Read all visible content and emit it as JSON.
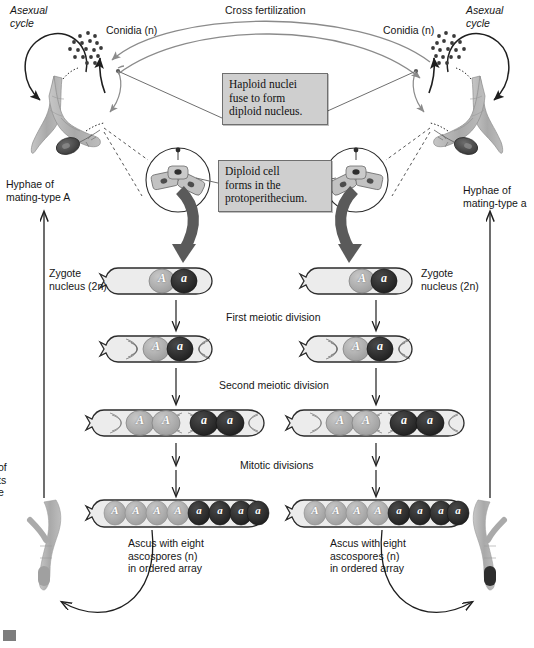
{
  "figure": {
    "title": "Cross fertilization"
  },
  "labels": {
    "cross_fertilization": "Cross fertilization",
    "asexual_cycle_left": "Asexual\ncycle",
    "asexual_cycle_right": "Asexual\ncycle",
    "conidia_left": "Conidia (n)",
    "conidia_right": "Conidia (n)",
    "hyphae_left": "Hyphae of\nmating-type A",
    "hyphae_right": "Hyphae of\nmating-type a",
    "zygote_left": "Zygote\nnucleus (2n)",
    "zygote_right": "Zygote\nnucleus (2n)",
    "first_meiotic": "First meiotic division",
    "second_meiotic": "Second meiotic division",
    "mitotic": "Mitotic divisions",
    "ascus_left": "Ascus with eight\nascospores (n)\nin ordered array",
    "ascus_right": "Ascus with eight\nascospores (n)\nin ordered array",
    "margin_cutoff": "of\nts\ne"
  },
  "callouts": [
    {
      "name": "haploid-fusion-callout",
      "text": "Haploid nuclei\nfuse to form\ndiploid nucleus."
    },
    {
      "name": "diploid-cell-callout",
      "text": "Diploid cell\nforms in the\nprotoperithecium."
    }
  ],
  "alleles": {
    "A": "A",
    "a": "a"
  },
  "stages": {
    "zygote": {
      "nuclei": [
        "A",
        "a"
      ]
    },
    "first_meiotic": {
      "nuclei": [
        "A",
        "a"
      ]
    },
    "second_meiotic": {
      "nuclei": [
        "A",
        "A",
        "a",
        "a"
      ]
    },
    "ascus": {
      "nuclei": [
        "A",
        "A",
        "A",
        "A",
        "a",
        "a",
        "a",
        "a"
      ]
    }
  },
  "colors": {
    "allele_A_fill": "#a8a8a8",
    "allele_a_fill": "#2b2b2b",
    "hypha_fill": "#b3b3b3",
    "cell_fill": "#e8e8e8",
    "callout_bg": "#cfcfcf",
    "stroke": "#1f1f1f",
    "arrow_gray": "#8f8f8f",
    "thick_arrow": "#5a5a5a",
    "perithecium_dark": "#4a4a4a"
  }
}
